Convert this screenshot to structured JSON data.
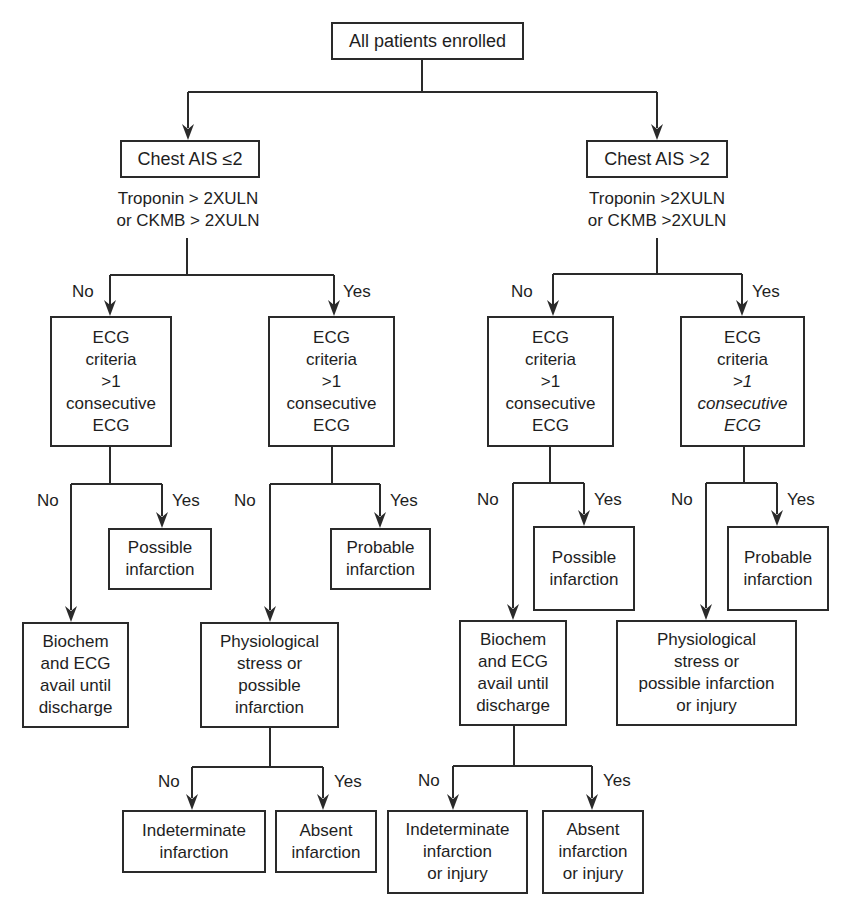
{
  "diagram": {
    "type": "decision-flowchart",
    "root": {
      "label": "All patients enrolled"
    },
    "branches": {
      "left": {
        "group_label": "Chest AIS ≤2",
        "criterion_lines": [
          "Troponin > 2XULN",
          "or CKMB > 2XULN"
        ],
        "no_label": "No",
        "yes_label": "Yes",
        "no_ecg": {
          "lines": [
            "ECG",
            "criteria",
            ">1",
            "consecutive",
            "ECG"
          ],
          "no_label": "No",
          "yes_label": "Yes",
          "yes_outcome": [
            "Possible",
            "infarction"
          ],
          "no_outcome": [
            "Biochem",
            "and ECG",
            "avail until",
            "discharge"
          ]
        },
        "yes_ecg": {
          "lines": [
            "ECG",
            "criteria",
            ">1",
            "consecutive",
            "ECG"
          ],
          "no_label": "No",
          "yes_label": "Yes",
          "yes_outcome": [
            "Probable",
            "infarction"
          ],
          "no_outcome": [
            "Physiological",
            "stress or",
            "possible",
            "infarction"
          ],
          "followup": {
            "no_label": "No",
            "yes_label": "Yes",
            "no_outcome": [
              "Indeterminate",
              "infarction"
            ],
            "yes_outcome": [
              "Absent",
              "infarction"
            ]
          }
        }
      },
      "right": {
        "group_label": "Chest AIS >2",
        "criterion_lines": [
          "Troponin >2XULN",
          "or CKMB >2XULN"
        ],
        "no_label": "No",
        "yes_label": "Yes",
        "no_ecg": {
          "lines": [
            "ECG",
            "criteria",
            ">1",
            "consecutive",
            "ECG"
          ],
          "no_label": "No",
          "yes_label": "Yes",
          "yes_outcome": [
            "Possible",
            "infarction"
          ],
          "no_outcome": [
            "Biochem",
            "and ECG",
            "avail until",
            "discharge"
          ],
          "followup": {
            "no_label": "No",
            "yes_label": "Yes",
            "no_outcome": [
              "Indeterminate",
              "infarction",
              "or injury"
            ],
            "yes_outcome": [
              "Absent",
              "infarction",
              "or injury"
            ]
          }
        },
        "yes_ecg": {
          "lines": [
            "ECG",
            "criteria",
            ">1",
            "consecutive",
            "ECG"
          ],
          "no_label": "No",
          "yes_label": "Yes",
          "yes_outcome": [
            "Probable",
            "infarction"
          ],
          "no_outcome": [
            "Physiological",
            "stress or",
            "possible infarction",
            "or injury"
          ]
        }
      }
    }
  },
  "colors": {
    "line": "#2a2a2a",
    "text": "#1e1e1e",
    "background": "#ffffff"
  }
}
